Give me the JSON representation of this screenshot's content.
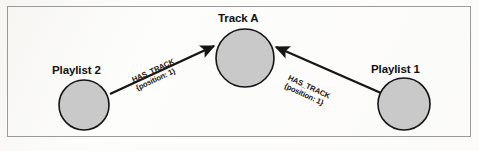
{
  "figure": {
    "kind": "graph-diagram",
    "background_color": "#fdfdfc",
    "frame_color": "#9a9a9a"
  },
  "style": {
    "node_fill": "#c9c9c9",
    "node_stroke": "#141414",
    "edge_color": "#161616",
    "text_color": "#111111"
  },
  "nodes": [
    {
      "id": "track-a",
      "label": "Track A",
      "cx": 245,
      "cy": 58,
      "r": 29,
      "label_x": 218,
      "label_y": 12
    },
    {
      "id": "playlist-2",
      "label": "Playlist 2",
      "cx": 84,
      "cy": 105,
      "r": 25,
      "label_x": 52,
      "label_y": 64
    },
    {
      "id": "playlist-1",
      "label": "Playlist 1",
      "cx": 404,
      "cy": 104,
      "r": 26,
      "label_x": 371,
      "label_y": 63
    }
  ],
  "edges": [
    {
      "id": "edge-playlist2-track-a",
      "from": "playlist-2",
      "to": "track-a",
      "type": "HAS_TRACK",
      "label_line1": "HAS_TRACK",
      "label_line2": "{position: 1}",
      "properties": {
        "position": 1
      },
      "x1": 110,
      "y1": 94,
      "x2": 214,
      "y2": 46,
      "label_x": 131,
      "label_y": 77,
      "label_rotate": -25
    },
    {
      "id": "edge-playlist1-track-a",
      "from": "playlist-1",
      "to": "track-a",
      "type": "HAS_TRACK",
      "label_line1": "HAS_TRACK",
      "label_line2": "{position: 1}",
      "properties": {
        "position": 1
      },
      "x1": 381,
      "y1": 93,
      "x2": 276,
      "y2": 47,
      "label_x": 290,
      "label_y": 74,
      "label_rotate": 25
    }
  ]
}
